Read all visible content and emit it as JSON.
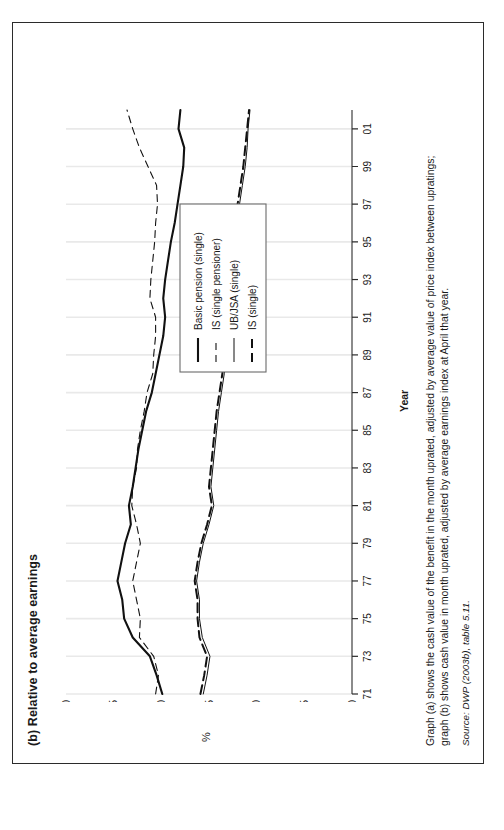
{
  "figure": {
    "title": "(b) Relative to average earnings",
    "x_axis_label": "Year",
    "y_axis_label": "%"
  },
  "caption": {
    "line1": "Graph (a) shows the cash value of the benefit in the month uprated, adjusted by average value of price index between upratings;",
    "line2": "graph (b) shows cash value in month uprated, adjusted by average earnings index at April that year.",
    "source": "Source: DWP (2003b), table 5.11."
  },
  "legend": {
    "items": [
      {
        "label": "Basic pension (single)",
        "style": "solid-thick"
      },
      {
        "label": "IS (single pensioner)",
        "style": "dashed-thin"
      },
      {
        "label": "UB/JSA (single)",
        "style": "solid-thin"
      },
      {
        "label": "IS (single)",
        "style": "dashed-thick"
      }
    ]
  },
  "chart_data": {
    "type": "line",
    "title": "(b) Relative to average earnings",
    "xlabel": "Year",
    "ylabel": "%",
    "xlim": [
      1971,
      2002
    ],
    "ylim": [
      0,
      30
    ],
    "yticks": [
      0,
      5,
      10,
      15,
      20,
      25,
      30
    ],
    "ytick_labels": [
      "0",
      "5",
      "10",
      "15",
      "20",
      "25",
      "30"
    ],
    "xticks": [
      1971,
      1973,
      1975,
      1977,
      1979,
      1981,
      1983,
      1985,
      1987,
      1989,
      1991,
      1993,
      1995,
      1997,
      1999,
      2001
    ],
    "xtick_labels": [
      "71",
      "73",
      "75",
      "77",
      "79",
      "81",
      "83",
      "85",
      "87",
      "89",
      "91",
      "93",
      "95",
      "97",
      "99",
      "01"
    ],
    "grid": "vertical-only",
    "legend_position": "inside-right",
    "x": [
      1971,
      1972,
      1973,
      1974,
      1975,
      1976,
      1977,
      1978,
      1979,
      1980,
      1981,
      1982,
      1983,
      1984,
      1985,
      1986,
      1987,
      1988,
      1989,
      1990,
      1991,
      1992,
      1993,
      1994,
      1995,
      1996,
      1997,
      1998,
      1999,
      2000,
      2001,
      2002
    ],
    "series": [
      {
        "name": "Basic pension (single)",
        "style": "solid-thick",
        "values": [
          19.9,
          20.5,
          21.2,
          23.0,
          23.9,
          24.1,
          24.6,
          24.2,
          23.8,
          23.2,
          23.4,
          23.0,
          22.7,
          22.4,
          22.0,
          21.6,
          21.0,
          20.6,
          20.2,
          19.8,
          19.6,
          19.8,
          19.6,
          19.3,
          19.0,
          18.6,
          18.3,
          18.0,
          17.7,
          17.6,
          18.2,
          18.0
        ]
      },
      {
        "name": "IS (single pensioner)",
        "style": "dashed-thin",
        "values": [
          20.6,
          20.3,
          20.8,
          22.3,
          22.2,
          22.6,
          23.0,
          22.6,
          22.2,
          22.6,
          23.1,
          23.0,
          22.6,
          22.5,
          22.2,
          21.8,
          21.5,
          20.9,
          20.8,
          20.6,
          20.6,
          21.2,
          21.1,
          20.9,
          20.7,
          20.6,
          20.4,
          20.5,
          21.4,
          22.3,
          23.0,
          23.6
        ]
      },
      {
        "name": "UB/JSA (single)",
        "style": "solid-thin",
        "values": [
          15.6,
          15.2,
          14.9,
          15.7,
          16.0,
          16.0,
          16.3,
          16.0,
          15.6,
          15.0,
          14.5,
          14.8,
          14.6,
          14.4,
          14.2,
          14.0,
          13.7,
          13.4,
          13.1,
          12.9,
          12.8,
          13.0,
          12.8,
          12.6,
          12.3,
          12.0,
          11.8,
          11.5,
          11.2,
          11.0,
          10.9,
          10.7
        ]
      },
      {
        "name": "IS (single)",
        "style": "dashed-thick",
        "values": [
          15.9,
          15.5,
          15.2,
          16.0,
          16.2,
          16.2,
          16.5,
          16.2,
          15.8,
          15.2,
          14.7,
          15.0,
          14.8,
          14.6,
          14.4,
          14.2,
          13.9,
          13.6,
          13.3,
          13.1,
          13.0,
          13.2,
          13.0,
          12.8,
          12.5,
          12.2,
          12.0,
          11.7,
          11.4,
          11.2,
          11.0,
          10.8
        ]
      }
    ]
  }
}
